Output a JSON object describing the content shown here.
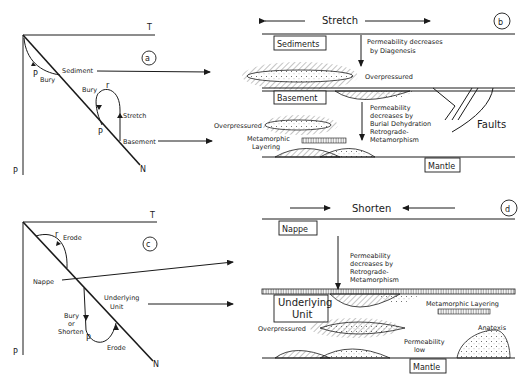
{
  "panel_a": {
    "id_label": "a",
    "axis_t": "T",
    "axis_p": "P",
    "geotherm_label": "N",
    "path_labels": {
      "p1": "P",
      "bury1": "Bury",
      "sediment": "Sediment",
      "bury2": "Bury",
      "r": "r",
      "stretch": "Stretch",
      "p2": "P",
      "basement": "Basement"
    }
  },
  "panel_b": {
    "id_label": "b",
    "title": "Stretch",
    "sediments": "Sediments",
    "perm_diagenesis": [
      "Permeability decreases",
      "by Diagenesis"
    ],
    "overpressured_top": "Overpressured",
    "basement": "Basement",
    "perm_burial": [
      "Permeability",
      "decreases by",
      "Burial Dehydration",
      "Retrograde-",
      "Metamorphism"
    ],
    "overpressured_mid": "Overpressured",
    "metamorphic_layering": [
      "Metamorphic",
      "Layering"
    ],
    "faults": "Faults",
    "mantle": "Mantle"
  },
  "panel_c": {
    "id_label": "c",
    "axis_t": "T",
    "axis_p": "P",
    "geotherm_label": "N",
    "path_labels": {
      "r": "r",
      "erode1": "Erode",
      "nappe": "Nappe",
      "underlying": [
        "Underlying",
        "Unit"
      ],
      "bury_shorten": [
        "Bury",
        "or",
        "Shorten"
      ],
      "p": "P",
      "erode2": "Erode"
    }
  },
  "panel_d": {
    "id_label": "d",
    "title": "Shorten",
    "nappe": "Nappe",
    "perm_retrograde": [
      "Permeability",
      "decreases by",
      "Retrograde-",
      "Metamorphism"
    ],
    "underlying": [
      "Underlying",
      "Unit"
    ],
    "metamorphic_layering": "Metamorphic Layering",
    "overpressured": "Overpressured",
    "anatexis": "Anatexis",
    "perm_low": [
      "Permeability",
      "low"
    ],
    "mantle": "Mantle"
  }
}
